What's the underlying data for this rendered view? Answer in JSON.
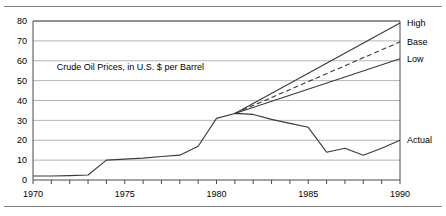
{
  "chart_data": {
    "type": "line",
    "title": "",
    "annotation": "Crude Oil Prices, in U.S. $ per Barrel",
    "xlabel": "",
    "ylabel": "",
    "xlim": [
      1970,
      1990
    ],
    "ylim": [
      0,
      80
    ],
    "grid": true,
    "legend_position": "right-inline-labels",
    "y_ticks": [
      0,
      10,
      20,
      30,
      40,
      50,
      60,
      70,
      80
    ],
    "y_tick_labels": [
      "0",
      "10",
      "20",
      "30",
      "40",
      "50",
      "60",
      "70",
      "80"
    ],
    "x_ticks": [
      1970,
      1971,
      1972,
      1973,
      1974,
      1975,
      1976,
      1977,
      1978,
      1979,
      1980,
      1981,
      1982,
      1983,
      1984,
      1985,
      1986,
      1987,
      1988,
      1989,
      1990
    ],
    "x_tick_labels_shown": [
      "1970",
      "1975",
      "1980",
      "1985",
      "1990"
    ],
    "x_tick_labels_shown_values": [
      1970,
      1975,
      1980,
      1985,
      1990
    ],
    "series": [
      {
        "name": "Actual",
        "label": "Actual",
        "style": "solid",
        "x": [
          1970,
          1971,
          1972,
          1973,
          1974,
          1975,
          1976,
          1977,
          1978,
          1979,
          1980,
          1981,
          1982,
          1983,
          1984,
          1985,
          1986,
          1987,
          1988,
          1989,
          1990
        ],
        "values": [
          2,
          2,
          2.2,
          2.5,
          10,
          10.5,
          11,
          11.8,
          12.5,
          17,
          31,
          33.5,
          33,
          30.5,
          28.5,
          26.5,
          14,
          16,
          12.5,
          16,
          20
        ]
      },
      {
        "name": "High",
        "label": "High",
        "style": "solid",
        "x": [
          1981,
          1990
        ],
        "values": [
          33.5,
          79
        ]
      },
      {
        "name": "Base",
        "label": "Base",
        "style": "dashed",
        "x": [
          1981,
          1990
        ],
        "values": [
          33.5,
          69.5
        ]
      },
      {
        "name": "Low",
        "label": "Low",
        "style": "solid",
        "x": [
          1981,
          1990
        ],
        "values": [
          33.5,
          61
        ]
      }
    ]
  },
  "colors": {
    "gridline": "#b5b5b5",
    "axis": "#4a4a4a",
    "data": "#3a3a3a",
    "rule": "#808080",
    "background": "#ffffff"
  }
}
